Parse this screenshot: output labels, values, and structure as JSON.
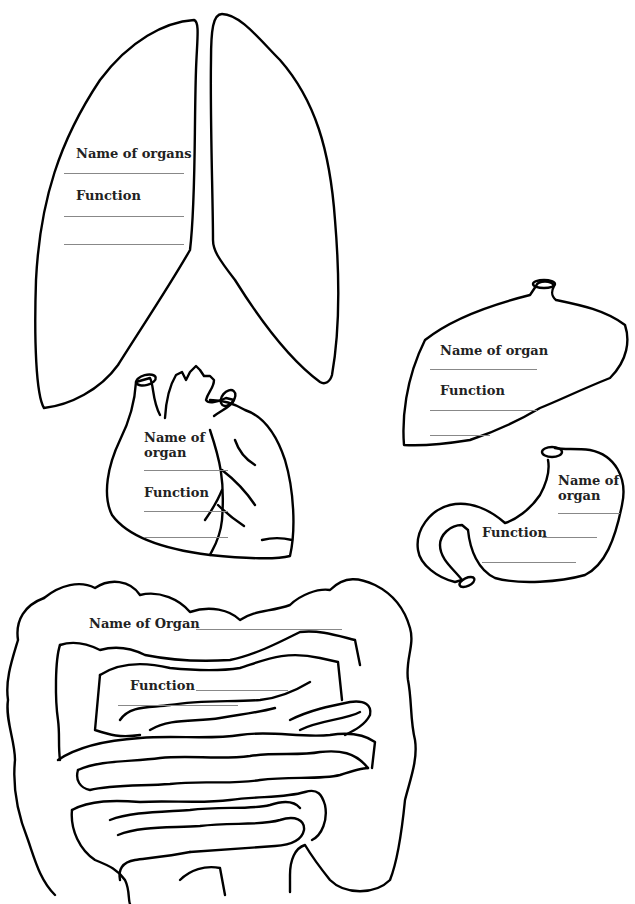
{
  "worksheet": {
    "lungs": {
      "name_label": "Name of organs",
      "function_label": "Function"
    },
    "heart": {
      "name_label_line1": "Name of",
      "name_label_line2": "organ",
      "function_label": "Function"
    },
    "liver": {
      "name_label": "Name of organ",
      "function_label": "Function"
    },
    "stomach": {
      "name_label_line1": "Name of",
      "name_label_line2": "organ",
      "function_label": "Function"
    },
    "intestines": {
      "name_label": "Name of Organ",
      "function_label": "Function"
    }
  },
  "colors": {
    "outline": "#000000",
    "answer_line": "#888888",
    "text": "#222222"
  }
}
